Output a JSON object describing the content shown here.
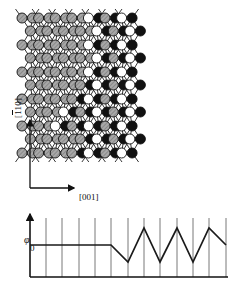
{
  "figure": {
    "background": "#ffffff",
    "line_color": "#1a1a1a",
    "width": 233,
    "height": 290
  },
  "axes": {
    "vertical_label": "[110]",
    "vertical_label_has_overbar_on": "first-1",
    "horizontal_label": "[001]",
    "origin_x": 30,
    "origin_y": 188,
    "vertical_tip_y": 120,
    "horizontal_tip_x": 74
  },
  "lattice": {
    "description": "Honeycomb chain lattice of dimerized atom pairs; left domain symmetric (gray), right domain buckled (white/black alternating), separated by a diagonal antiphase boundary.",
    "atom_types": [
      {
        "key": "gray",
        "label": "symmetric dimer atom",
        "fill": "#9a9a9a",
        "stroke": "#111111",
        "hatched": true
      },
      {
        "key": "white",
        "label": "buckled-up atom",
        "fill": "#ffffff",
        "stroke": "#111111",
        "hatched": false
      },
      {
        "key": "black",
        "label": "buckled-down atom",
        "fill": "#111111",
        "stroke": "#111111",
        "hatched": false
      }
    ],
    "atom_radius": 5.0,
    "dimer_bond_style": "double-line",
    "backbond_style": "single-line",
    "col_spacing": 16.6,
    "row_spacing": 13.6,
    "origin_px": {
      "x": 28,
      "y": 18
    },
    "rows": [
      {
        "y": 18,
        "offset": 0,
        "cells": [
          "gray",
          "gray",
          "gray",
          "gray",
          "white",
          "black",
          "white"
        ]
      },
      {
        "y": 31,
        "offset": 1,
        "cells": [
          "gray",
          "gray",
          "gray",
          "gray",
          "white",
          "black",
          "white"
        ]
      },
      {
        "y": 45,
        "offset": 0,
        "cells": [
          "gray",
          "gray",
          "gray",
          "gray",
          "white",
          "black",
          "white"
        ]
      },
      {
        "y": 58,
        "offset": 1,
        "cells": [
          "gray",
          "gray",
          "gray",
          "gray",
          "white",
          "black",
          "white"
        ]
      },
      {
        "y": 72,
        "offset": 0,
        "cells": [
          "gray",
          "gray",
          "gray",
          "gray",
          "white",
          "black",
          "white"
        ]
      },
      {
        "y": 85,
        "offset": 1,
        "cells": [
          "gray",
          "gray",
          "gray",
          "black",
          "white",
          "black",
          "white"
        ]
      },
      {
        "y": 99,
        "offset": 0,
        "cells": [
          "gray",
          "gray",
          "gray",
          "black",
          "white",
          "black",
          "white"
        ]
      },
      {
        "y": 112,
        "offset": 1,
        "cells": [
          "gray",
          "gray",
          "white",
          "black",
          "white",
          "black",
          "white"
        ]
      },
      {
        "y": 126,
        "offset": 0,
        "cells": [
          "gray",
          "gray",
          "white",
          "black",
          "white",
          "black",
          "white"
        ]
      },
      {
        "y": 139,
        "offset": 1,
        "cells": [
          "gray",
          "gray",
          "gray",
          "black",
          "white",
          "black",
          "white"
        ]
      },
      {
        "y": 153,
        "offset": 0,
        "cells": [
          "gray",
          "gray",
          "gray",
          "black",
          "white",
          "black",
          "white"
        ]
      }
    ]
  },
  "chart_data": {
    "type": "line",
    "title": "",
    "ylabel": "φ",
    "xlabel": "",
    "y_zero_label": "0",
    "grid": true,
    "gridlines_x": [
      30,
      46,
      62,
      79,
      95,
      111,
      128,
      144,
      160,
      177,
      193,
      209,
      226
    ],
    "axis": {
      "x_min": 30,
      "x_max": 228,
      "baseline_y": 277,
      "zero_y": 245,
      "top_y": 218,
      "amplitude": 17
    },
    "series": [
      {
        "name": "phase φ",
        "comment": "flat at 0 through the symmetric domain, then a triangular zigzag of alternating ± phase in the buckled domain",
        "points": [
          {
            "x": 30,
            "phi": 0
          },
          {
            "x": 111,
            "phi": 0
          },
          {
            "x": 128,
            "phi": -1
          },
          {
            "x": 144,
            "phi": 1
          },
          {
            "x": 160,
            "phi": -1
          },
          {
            "x": 177,
            "phi": 1
          },
          {
            "x": 193,
            "phi": -1
          },
          {
            "x": 209,
            "phi": 1
          },
          {
            "x": 226,
            "phi": 0
          }
        ]
      }
    ],
    "ylim": [
      -1.6,
      1.6
    ]
  }
}
